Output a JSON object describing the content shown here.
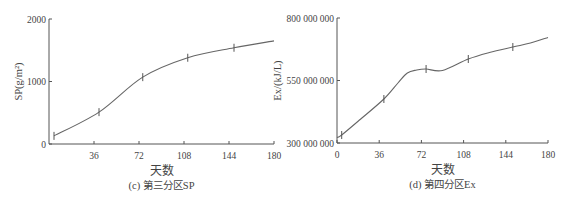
{
  "chart_data": [
    {
      "type": "line",
      "panel_id": "c",
      "caption": "(c) 第三分区SP",
      "xlabel": "天数",
      "ylabel": "SP(g/m²)",
      "xlim": [
        0,
        180
      ],
      "ylim": [
        0,
        2000
      ],
      "xticks": [
        36,
        72,
        108,
        144,
        180
      ],
      "yticks": [
        0,
        1000,
        2000
      ],
      "ytick_labels": [
        "0",
        "1000",
        "2000"
      ],
      "grid": false,
      "series": [
        {
          "name": "SP",
          "x": [
            4,
            40,
            75,
            111,
            148,
            180
          ],
          "y": [
            130,
            510,
            1070,
            1380,
            1540,
            1650
          ],
          "error_bar_x": [
            4,
            40,
            75,
            111,
            148
          ]
        }
      ]
    },
    {
      "type": "line",
      "panel_id": "d",
      "caption": "(d) 第四分区Ex",
      "xlabel": "天数",
      "ylabel": "Ex/(kJ/L)",
      "xlim": [
        0,
        180
      ],
      "ylim": [
        300000000,
        800000000
      ],
      "xticks": [
        0,
        36,
        72,
        108,
        144,
        180
      ],
      "yticks": [
        300000000,
        550000000,
        800000000
      ],
      "ytick_labels": [
        "300 000 000",
        "550 000 000",
        "800 000 000"
      ],
      "grid": false,
      "series": [
        {
          "name": "Ex",
          "x": [
            0,
            4,
            20,
            40,
            52,
            60,
            68,
            76,
            90,
            112,
            130,
            150,
            165,
            180
          ],
          "y": [
            322000000,
            332000000,
            395000000,
            476000000,
            540000000,
            580000000,
            592000000,
            596000000,
            590000000,
            636000000,
            662000000,
            684000000,
            700000000,
            722000000
          ],
          "error_bar_x": [
            4,
            40,
            76,
            112,
            150
          ]
        }
      ]
    }
  ]
}
